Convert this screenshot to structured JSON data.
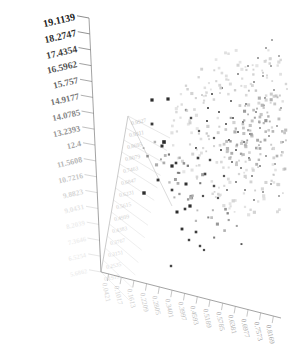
{
  "chart_data": {
    "type": "scatter",
    "title": "",
    "xlabel": "",
    "ylabel": "",
    "zlabel": "",
    "grid": true,
    "legend": "none",
    "projection": "3d-skewed",
    "yaxis": {
      "tick_labels": [
        "19.1139",
        "18.2747",
        "17.4354",
        "16.5962",
        "15.757",
        "14.9177",
        "14.0785",
        "13.2393",
        "12.4",
        "11.5608",
        "10.7216",
        "9.8823",
        "9.0431",
        "8.2039",
        "7.3646",
        "6.5254",
        "5.6862"
      ],
      "range": [
        5.6862,
        19.1139
      ],
      "step": 0.8392,
      "tick_count": 17
    },
    "xaxis": {
      "tick_labels": [
        "0.0421",
        "0.1017",
        "0.1613",
        "0.2209",
        "0.2805",
        "0.3401",
        "0.3997",
        "0.4593",
        "0.5189",
        "0.5785",
        "0.6381",
        "0.6977",
        "0.7573",
        "0.8169"
      ],
      "tick_count": 14,
      "range": [
        0.0421,
        0.8169
      ]
    },
    "zaxis": {
      "tick_labels": [
        "0.9927",
        "0.9311",
        "0.8695",
        "0.8079",
        "0.7463",
        "0.6847",
        "0.6231",
        "0.5615",
        "0.4999",
        "0.4383",
        "0.3767",
        "0.3151",
        "0.2535",
        "0.1919"
      ],
      "tick_count": 14,
      "range": [
        0.1919,
        0.9927
      ]
    },
    "point_count": 430,
    "marker": {
      "shape": "square",
      "dark_color": "#2b2b2b",
      "light_color": "#c9c9c9",
      "size_px": 3
    },
    "axis_color": "#8c8c8c",
    "grid_color": "#d8d8d8",
    "background": "#ffffff",
    "points": [
      {
        "x": 144,
        "y": 193,
        "s": 3.4,
        "c": "#2e2e2e"
      },
      {
        "x": 152,
        "y": 100,
        "s": 3.2,
        "c": "#2b2b2b"
      },
      {
        "x": 168,
        "y": 99,
        "s": 3.2,
        "c": "#2f2f2f"
      },
      {
        "x": 152,
        "y": 124,
        "s": 2.8,
        "c": "#3a3a3a"
      },
      {
        "x": 164,
        "y": 142,
        "s": 3.6,
        "c": "#2a2a2a"
      },
      {
        "x": 162,
        "y": 146,
        "s": 3.0,
        "c": "#333333"
      },
      {
        "x": 172,
        "y": 166,
        "s": 3.2,
        "c": "#2d2d2d"
      },
      {
        "x": 176,
        "y": 163,
        "s": 2.6,
        "c": "#3c3c3c"
      },
      {
        "x": 158,
        "y": 180,
        "s": 2.8,
        "c": "#353535"
      },
      {
        "x": 186,
        "y": 184,
        "s": 3.0,
        "c": "#303030"
      },
      {
        "x": 172,
        "y": 190,
        "s": 2.6,
        "c": "#3e3e3e"
      },
      {
        "x": 177,
        "y": 212,
        "s": 3.0,
        "c": "#2c2c2c"
      },
      {
        "x": 185,
        "y": 209,
        "s": 2.6,
        "c": "#3b3b3b"
      },
      {
        "x": 190,
        "y": 206,
        "s": 3.2,
        "c": "#2e2e2e"
      },
      {
        "x": 182,
        "y": 229,
        "s": 2.8,
        "c": "#343434"
      },
      {
        "x": 196,
        "y": 232,
        "s": 2.6,
        "c": "#3d3d3d"
      },
      {
        "x": 189,
        "y": 240,
        "s": 2.4,
        "c": "#444444"
      },
      {
        "x": 200,
        "y": 246,
        "s": 2.4,
        "c": "#484848"
      },
      {
        "x": 204,
        "y": 250,
        "s": 2.2,
        "c": "#4e4e4e"
      },
      {
        "x": 171,
        "y": 266,
        "s": 2.4,
        "c": "#464646"
      },
      {
        "x": 205,
        "y": 174,
        "s": 2.6,
        "c": "#3f3f3f"
      },
      {
        "x": 210,
        "y": 160,
        "s": 2.4,
        "c": "#4a4a4a"
      },
      {
        "x": 198,
        "y": 158,
        "s": 2.6,
        "c": "#424242"
      },
      {
        "x": 214,
        "y": 186,
        "s": 2.4,
        "c": "#4c4c4c"
      },
      {
        "x": 203,
        "y": 196,
        "s": 2.2,
        "c": "#525252"
      },
      {
        "x": 218,
        "y": 198,
        "s": 2.2,
        "c": "#555555"
      },
      {
        "x": 224,
        "y": 176,
        "s": 2.2,
        "c": "#585858"
      },
      {
        "x": 191,
        "y": 118,
        "s": 2.4,
        "c": "#4a4a4a"
      },
      {
        "x": 186,
        "y": 110,
        "s": 2.2,
        "c": "#565656"
      },
      {
        "x": 199,
        "y": 131,
        "s": 2.2,
        "c": "#545454"
      },
      {
        "x": 207,
        "y": 121,
        "s": 2.0,
        "c": "#5e5e5e"
      },
      {
        "x": 214,
        "y": 138,
        "s": 2.2,
        "c": "#5a5a5a"
      },
      {
        "x": 196,
        "y": 148,
        "s": 2.0,
        "c": "#606060"
      },
      {
        "x": 221,
        "y": 150,
        "s": 2.0,
        "c": "#646464"
      },
      {
        "x": 229,
        "y": 140,
        "s": 2.0,
        "c": "#686868"
      },
      {
        "x": 208,
        "y": 108,
        "s": 2.0,
        "c": "#626262"
      },
      {
        "x": 219,
        "y": 112,
        "s": 2.0,
        "c": "#6a6a6a"
      },
      {
        "x": 226,
        "y": 124,
        "s": 2.0,
        "c": "#6e6e6e"
      },
      {
        "x": 233,
        "y": 118,
        "s": 2.0,
        "c": "#727272"
      },
      {
        "x": 212,
        "y": 94,
        "s": 2.0,
        "c": "#6c6c6c"
      },
      {
        "x": 222,
        "y": 88,
        "s": 2.0,
        "c": "#747474"
      },
      {
        "x": 231,
        "y": 101,
        "s": 2.0,
        "c": "#787878"
      },
      {
        "x": 238,
        "y": 132,
        "s": 2.0,
        "c": "#767676"
      },
      {
        "x": 243,
        "y": 122,
        "s": 2.0,
        "c": "#7c7c7c"
      },
      {
        "x": 236,
        "y": 150,
        "s": 2.0,
        "c": "#7a7a7a"
      },
      {
        "x": 244,
        "y": 142,
        "s": 2.0,
        "c": "#808080"
      },
      {
        "x": 250,
        "y": 134,
        "s": 2.0,
        "c": "#848484"
      },
      {
        "x": 232,
        "y": 162,
        "s": 2.0,
        "c": "#828282"
      },
      {
        "x": 241,
        "y": 168,
        "s": 2.0,
        "c": "#888888"
      },
      {
        "x": 249,
        "y": 158,
        "s": 2.0,
        "c": "#8a8a8a"
      },
      {
        "x": 256,
        "y": 148,
        "s": 2.0,
        "c": "#8e8e8e"
      },
      {
        "x": 227,
        "y": 190,
        "s": 2.0,
        "c": "#8c8c8c"
      },
      {
        "x": 236,
        "y": 182,
        "s": 2.0,
        "c": "#909090"
      },
      {
        "x": 245,
        "y": 190,
        "s": 2.0,
        "c": "#949494"
      },
      {
        "x": 252,
        "y": 176,
        "s": 2.0,
        "c": "#929292"
      },
      {
        "x": 260,
        "y": 166,
        "s": 2.0,
        "c": "#989898"
      },
      {
        "x": 238,
        "y": 74,
        "s": 2.0,
        "c": "#9a9a9a"
      },
      {
        "x": 248,
        "y": 66,
        "s": 2.0,
        "c": "#a0a0a0"
      },
      {
        "x": 258,
        "y": 58,
        "s": 2.0,
        "c": "#a4a4a4"
      },
      {
        "x": 266,
        "y": 48,
        "s": 2.0,
        "c": "#a8a8a8"
      },
      {
        "x": 272,
        "y": 40,
        "s": 2.0,
        "c": "#acacac"
      },
      {
        "x": 254,
        "y": 82,
        "s": 2.0,
        "c": "#9e9e9e"
      },
      {
        "x": 263,
        "y": 76,
        "s": 2.0,
        "c": "#a6a6a6"
      },
      {
        "x": 271,
        "y": 66,
        "s": 2.0,
        "c": "#aaaaaa"
      },
      {
        "x": 279,
        "y": 56,
        "s": 2.0,
        "c": "#b0b0b0"
      },
      {
        "x": 246,
        "y": 104,
        "s": 2.0,
        "c": "#969696"
      },
      {
        "x": 256,
        "y": 112,
        "s": 2.0,
        "c": "#9c9c9c"
      },
      {
        "x": 265,
        "y": 98,
        "s": 2.0,
        "c": "#a2a2a2"
      },
      {
        "x": 274,
        "y": 90,
        "s": 2.0,
        "c": "#a8a8a8"
      },
      {
        "x": 281,
        "y": 108,
        "s": 2.0,
        "c": "#aeaeae"
      },
      {
        "x": 260,
        "y": 128,
        "s": 2.0,
        "c": "#a0a0a0"
      },
      {
        "x": 269,
        "y": 136,
        "s": 2.0,
        "c": "#a6a6a6"
      },
      {
        "x": 277,
        "y": 126,
        "s": 2.0,
        "c": "#acacac"
      },
      {
        "x": 283,
        "y": 142,
        "s": 2.0,
        "c": "#b2b2b2"
      },
      {
        "x": 266,
        "y": 156,
        "s": 2.0,
        "c": "#a4a4a4"
      },
      {
        "x": 275,
        "y": 164,
        "s": 2.0,
        "c": "#aaaaaa"
      },
      {
        "x": 282,
        "y": 152,
        "s": 2.0,
        "c": "#b0b0b0"
      },
      {
        "x": 254,
        "y": 200,
        "s": 2.0,
        "c": "#9c9c9c"
      },
      {
        "x": 263,
        "y": 192,
        "s": 2.0,
        "c": "#a2a2a2"
      },
      {
        "x": 271,
        "y": 184,
        "s": 2.0,
        "c": "#a8a8a8"
      },
      {
        "x": 279,
        "y": 196,
        "s": 2.0,
        "c": "#aeaeae"
      }
    ]
  },
  "yaxis_ticks": [
    {
      "label": "19.1139",
      "t": 0
    },
    {
      "label": "18.2747",
      "t": 1
    },
    {
      "label": "17.4354",
      "t": 2
    },
    {
      "label": "16.5962",
      "t": 3
    },
    {
      "label": "15.757",
      "t": 4
    },
    {
      "label": "14.9177",
      "t": 5
    },
    {
      "label": "14.0785",
      "t": 6
    },
    {
      "label": "13.2393",
      "t": 7
    },
    {
      "label": "12.4",
      "t": 8
    },
    {
      "label": "11.5608",
      "t": 9
    },
    {
      "label": "10.7216",
      "t": 10
    },
    {
      "label": "9.8823",
      "t": 11
    },
    {
      "label": "9.0431",
      "t": 12
    },
    {
      "label": "8.2039",
      "t": 13
    },
    {
      "label": "7.3646",
      "t": 14
    },
    {
      "label": "6.5254",
      "t": 15
    },
    {
      "label": "5.6862",
      "t": 16
    }
  ],
  "xaxis_ticks": [
    {
      "label": "0.0421"
    },
    {
      "label": "0.1017"
    },
    {
      "label": "0.1613"
    },
    {
      "label": "0.2209"
    },
    {
      "label": "0.2805"
    },
    {
      "label": "0.3401"
    },
    {
      "label": "0.3997"
    },
    {
      "label": "0.4593"
    },
    {
      "label": "0.5189"
    },
    {
      "label": "0.5785"
    },
    {
      "label": "0.6381"
    },
    {
      "label": "0.6977"
    },
    {
      "label": "0.7573"
    },
    {
      "label": "0.8169"
    }
  ],
  "zaxis_ticks": [
    {
      "label": "0.9927"
    },
    {
      "label": "0.9311"
    },
    {
      "label": "0.8695"
    },
    {
      "label": "0.8079"
    },
    {
      "label": "0.7463"
    },
    {
      "label": "0.6847"
    },
    {
      "label": "0.6231"
    },
    {
      "label": "0.5615"
    },
    {
      "label": "0.4999"
    },
    {
      "label": "0.4383"
    },
    {
      "label": "0.3767"
    },
    {
      "label": "0.3151"
    },
    {
      "label": "0.2535"
    },
    {
      "label": "0.1919"
    }
  ]
}
